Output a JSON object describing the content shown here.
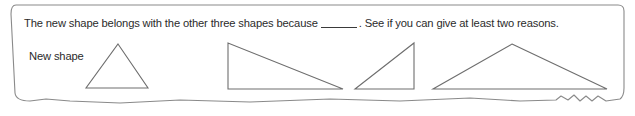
{
  "worksheet": {
    "prompt": {
      "before_blank": "The new shape belongs with the other three shapes because",
      "blank": "",
      "after_blank": ". See if you can give at least two reasons."
    },
    "new_shape_label": "New shape",
    "colors": {
      "text": "#2b2b2b",
      "shape_stroke": "#6e6e6e",
      "border": "#8a8a8a",
      "background": "#ffffff"
    },
    "shapes": [
      {
        "name": "new-shape-triangle",
        "kind": "isosceles-triangle",
        "points": "118,44 148,88 86,88"
      },
      {
        "name": "triangle-right-obtuse-wide",
        "kind": "right-triangle",
        "points": "228,43 228,89 343,89"
      },
      {
        "name": "triangle-right-small",
        "kind": "right-triangle",
        "points": "414,43 414,89 355,89"
      },
      {
        "name": "triangle-wide-isosceles",
        "kind": "obtuse-triangle",
        "points": "512,44 607,89 433,89"
      }
    ],
    "card_outline_path": "M 16 5 L 618 5 Q 624 5 624 11 L 624 88 Q 624 96 620 99 L 606 101 L 598 96 L 592 101 L 586 96 L 580 101 L 574 95 L 568 100 L 561 96 L 556 100 L 520 101 L 470 98 L 400 101 L 330 99 L 250 102 L 180 100 L 120 103 L 70 101 L 46 99 L 30 101 Q 16 101 15 93 L 11 14 Q 11 5 16 5 Z"
  }
}
